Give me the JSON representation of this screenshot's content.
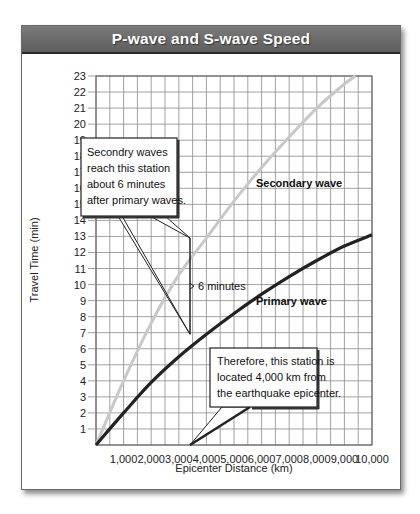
{
  "title": "P-wave and S-wave Speed",
  "chart_data": {
    "type": "line",
    "title": "P-wave and S-wave Speed",
    "xlabel": "Epicenter Distance (km)",
    "ylabel": "Travel Time (min)",
    "xlim": [
      0,
      10000
    ],
    "ylim": [
      0,
      23
    ],
    "grid": true,
    "x_ticks": [
      "1,000",
      "2,000",
      "3,000",
      "4,000",
      "5,000",
      "6,000",
      "7,000",
      "8,000",
      "9,000",
      "10,000"
    ],
    "y_ticks": [
      "1",
      "2",
      "3",
      "4",
      "5",
      "6",
      "7",
      "8",
      "9",
      "10",
      "11",
      "12",
      "13",
      "14",
      "15",
      "16",
      "17",
      "18",
      "19",
      "20",
      "21",
      "22",
      "23"
    ],
    "series": [
      {
        "name": "Secondary wave",
        "color": "#c8c8c8",
        "x": [
          0,
          1000,
          2000,
          3000,
          4000,
          5000,
          6000,
          7000,
          8000,
          9000,
          9400
        ],
        "y": [
          0,
          4.0,
          7.6,
          10.6,
          12.9,
          15.2,
          17.3,
          19.2,
          21.0,
          22.5,
          23.0
        ]
      },
      {
        "name": "Primary wave",
        "color": "#222222",
        "x": [
          0,
          1000,
          2000,
          3000,
          4000,
          5000,
          6000,
          7000,
          8000,
          9000,
          10000
        ],
        "y": [
          0,
          2.0,
          3.9,
          5.5,
          6.9,
          8.2,
          9.4,
          10.5,
          11.5,
          12.4,
          13.1
        ]
      }
    ],
    "annotations": [
      {
        "text_lines": [
          "Secondry waves",
          "reach this station",
          "about 6 minutes",
          "after primary waves."
        ],
        "points_to": [
          [
            4000,
            12.9
          ],
          [
            4000,
            6.9
          ]
        ]
      },
      {
        "text": "6 minutes",
        "bracket_x": 4000,
        "from_y": 6.9,
        "to_y": 12.9
      },
      {
        "text_lines": [
          "Therefore, this station is",
          "located 4,000  km from",
          "the earthquake epicenter."
        ],
        "points_to": [
          [
            4000,
            0
          ]
        ]
      }
    ],
    "legend": "inline labels"
  }
}
